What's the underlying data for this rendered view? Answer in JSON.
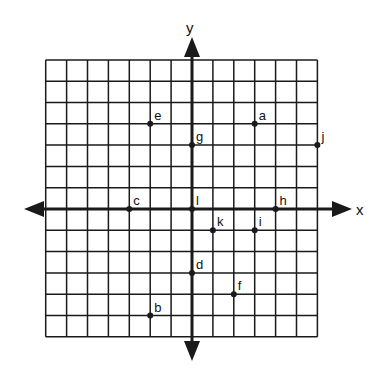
{
  "diagram": {
    "type": "coordinate-plane",
    "axes": {
      "x_label": "x",
      "y_label": "y"
    },
    "grid": {
      "x_min": -7,
      "x_max": 6,
      "y_min": -6,
      "y_max": 7,
      "step": 1,
      "show_grid": true
    },
    "points": [
      {
        "label": "a",
        "x": 3,
        "y": 4
      },
      {
        "label": "b",
        "x": -2,
        "y": -5
      },
      {
        "label": "c",
        "x": -3,
        "y": 0
      },
      {
        "label": "d",
        "x": 0,
        "y": -3
      },
      {
        "label": "e",
        "x": -2,
        "y": 4
      },
      {
        "label": "f",
        "x": 2,
        "y": -4
      },
      {
        "label": "g",
        "x": 0,
        "y": 3
      },
      {
        "label": "h",
        "x": 4,
        "y": 0
      },
      {
        "label": "i",
        "x": 3,
        "y": -1
      },
      {
        "label": "j",
        "x": 6,
        "y": 3
      },
      {
        "label": "k",
        "x": 1,
        "y": -1
      },
      {
        "label": "l",
        "x": 0,
        "y": 0
      }
    ]
  },
  "colors": {
    "line": "#1a1a1a",
    "background": "#ffffff"
  }
}
